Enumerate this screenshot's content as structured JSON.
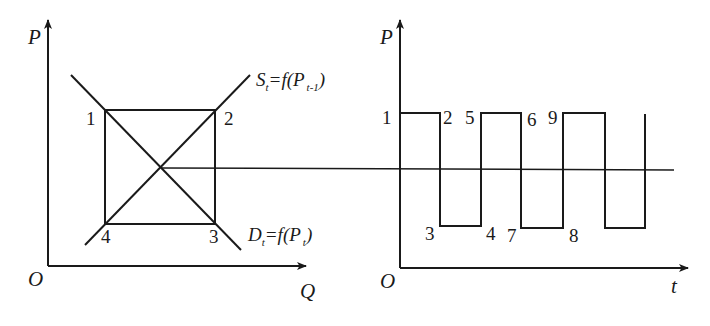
{
  "left_panel": {
    "y_axis_label": "P",
    "x_axis_label": "Q",
    "origin_label": "O",
    "supply_curve": {
      "main": "S",
      "sub": "t",
      "eq": "=f(P",
      "arg_sub": "t-1",
      "close": ")"
    },
    "demand_curve": {
      "main": "D",
      "sub": "t",
      "eq": "=f(P",
      "arg_sub": "t",
      "close": ")"
    },
    "corner_labels": [
      "1",
      "2",
      "3",
      "4"
    ]
  },
  "right_panel": {
    "y_axis_label": "P",
    "x_axis_label": "t",
    "origin_label": "O",
    "point_labels": {
      "high": [
        "1",
        "2",
        "5",
        "6",
        "9"
      ],
      "low": [
        "3",
        "4",
        "7",
        "8"
      ]
    }
  },
  "colors": {
    "line": "#1a1a1a",
    "background": "#ffffff"
  }
}
